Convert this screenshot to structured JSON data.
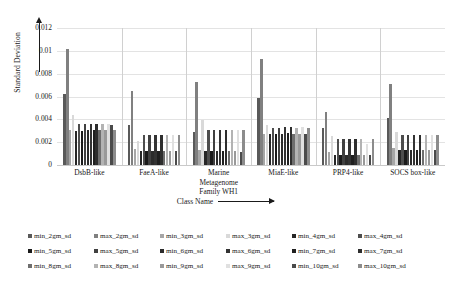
{
  "chart_data": {
    "type": "bar",
    "title": "",
    "xlabel": "Class Name",
    "ylabel": "Standard Deviation",
    "ylim": [
      0,
      0.012
    ],
    "yticks": [
      "0",
      "0.002",
      "0.004",
      "0.006",
      "0.008",
      "0.01",
      "0.012"
    ],
    "grid": true,
    "legend_position": "bottom",
    "categories": [
      "DsbB-like",
      "FaeA-like",
      "Marine Metagenome Family WH1",
      "MiaE-like",
      "PRP4-like",
      "SOCS box-like"
    ],
    "category_lines": [
      [
        "DsbB-like"
      ],
      [
        "FaeA-like"
      ],
      [
        "Marine",
        "Metagenome",
        "Family WH1"
      ],
      [
        "MiaE-like"
      ],
      [
        "PRP4-like"
      ],
      [
        "SOCS box-like"
      ]
    ],
    "series": [
      {
        "name": "min_2gm_sd",
        "color": "#595959",
        "values": [
          0.0062,
          0.0035,
          0.0029,
          0.0059,
          0.0032,
          0.0041
        ]
      },
      {
        "name": "max_2gm_sd",
        "color": "#808080",
        "values": [
          0.0102,
          0.0065,
          0.0073,
          0.0093,
          0.0046,
          0.0071
        ]
      },
      {
        "name": "min_3gm_sd",
        "color": "#a6a6a6",
        "values": [
          0.0031,
          0.0014,
          0.0013,
          0.0027,
          0.0011,
          0.0015
        ]
      },
      {
        "name": "max_3gm_sd",
        "color": "#d9d9d9",
        "values": [
          0.0044,
          0.0021,
          0.0039,
          0.0035,
          0.0025,
          0.0029
        ]
      },
      {
        "name": "min_4gm_sd",
        "color": "#262626",
        "values": [
          0.003,
          0.0012,
          0.0012,
          0.0027,
          0.0009,
          0.0013
        ]
      },
      {
        "name": "max_4gm_sd",
        "color": "#4d4d4d",
        "values": [
          0.0036,
          0.0026,
          0.0031,
          0.0032,
          0.0023,
          0.0026
        ]
      },
      {
        "name": "min_5gm_sd",
        "color": "#1a1a1a",
        "values": [
          0.003,
          0.0012,
          0.0012,
          0.0027,
          0.0009,
          0.0013
        ]
      },
      {
        "name": "max_5gm_sd",
        "color": "#404040",
        "values": [
          0.0036,
          0.0026,
          0.0031,
          0.0032,
          0.0023,
          0.0026
        ]
      },
      {
        "name": "min_6gm_sd",
        "color": "#2b2b2b",
        "values": [
          0.0031,
          0.0012,
          0.0012,
          0.0027,
          0.0009,
          0.0013
        ]
      },
      {
        "name": "max_6gm_sd",
        "color": "#333333",
        "values": [
          0.0036,
          0.0026,
          0.0031,
          0.0033,
          0.0023,
          0.0026
        ]
      },
      {
        "name": "min_7gm_sd",
        "color": "#1f1f1f",
        "values": [
          0.0031,
          0.0012,
          0.0012,
          0.0028,
          0.0009,
          0.0013
        ]
      },
      {
        "name": "max_7gm_sd",
        "color": "#2e2e2e",
        "values": [
          0.0036,
          0.0026,
          0.0031,
          0.0033,
          0.0023,
          0.0026
        ]
      },
      {
        "name": "min_8gm_sd",
        "color": "#6e6e6e",
        "values": [
          0.0031,
          0.0012,
          0.0012,
          0.0027,
          0.0009,
          0.0013
        ]
      },
      {
        "name": "max_8gm_sd",
        "color": "#b3b3b3",
        "values": [
          0.0036,
          0.0026,
          0.0031,
          0.0032,
          0.0023,
          0.0026
        ]
      },
      {
        "name": "min_9gm_sd",
        "color": "#999999",
        "values": [
          0.0031,
          0.0012,
          0.0012,
          0.0027,
          0.0009,
          0.0013
        ]
      },
      {
        "name": "max_9gm_sd",
        "color": "#e0e0e0",
        "values": [
          0.0036,
          0.0026,
          0.0031,
          0.0033,
          0.0018,
          0.0026
        ]
      },
      {
        "name": "min_10gm_sd",
        "color": "#4a4a4a",
        "values": [
          0.0035,
          0.0012,
          0.0011,
          0.0027,
          0.0009,
          0.0013
        ]
      },
      {
        "name": "max_10gm_sd",
        "color": "#8c8c8c",
        "values": [
          0.0031,
          0.0026,
          0.0031,
          0.0032,
          0.0023,
          0.0026
        ]
      }
    ]
  }
}
